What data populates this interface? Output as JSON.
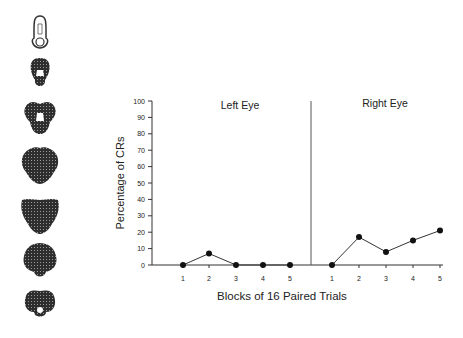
{
  "figure": {
    "brain_sections_label": "Serial brain section illustrations",
    "brain_section_count": 7
  },
  "chart_data": {
    "type": "line",
    "title": "",
    "xlabel": "Blocks of 16 Paired Trials",
    "ylabel": "Percentage of CRs",
    "ylim": [
      0,
      100
    ],
    "yticks": [
      0,
      10,
      20,
      30,
      40,
      50,
      60,
      70,
      80,
      90,
      100
    ],
    "grid": false,
    "panels": [
      {
        "name": "Left Eye",
        "categories": [
          "1",
          "2",
          "3",
          "4",
          "5"
        ],
        "values": [
          0,
          7,
          0,
          0,
          0
        ]
      },
      {
        "name": "Right Eye",
        "categories": [
          "1",
          "2",
          "3",
          "4",
          "5"
        ],
        "values": [
          0,
          17,
          8,
          15,
          21
        ]
      }
    ]
  }
}
